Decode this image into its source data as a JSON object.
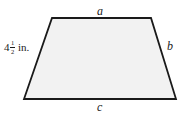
{
  "figure": {
    "type": "trapezoid-diagram",
    "canvas": {
      "width": 186,
      "height": 118,
      "background": "#ffffff"
    },
    "shape": {
      "name": "trapezoid",
      "fill": "#f2f2f2",
      "stroke": "#1a1a1a",
      "stroke_width": 1.8,
      "vertices": [
        {
          "name": "top-left",
          "x": 52,
          "y": 18
        },
        {
          "name": "top-right",
          "x": 151,
          "y": 18
        },
        {
          "name": "bottom-right",
          "x": 176,
          "y": 99
        },
        {
          "name": "bottom-left",
          "x": 24,
          "y": 99
        }
      ]
    },
    "labels": {
      "top_side": "a",
      "right_side": "b",
      "bottom_side": "c",
      "left_side": {
        "whole": "4",
        "numerator": "1",
        "denominator": "2",
        "unit": "in.",
        "plain_text": "4 1/2 in."
      }
    }
  }
}
